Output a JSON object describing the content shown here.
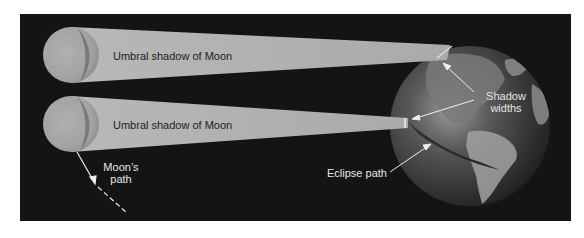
{
  "diagram": {
    "type": "solar-eclipse-umbral-shadow",
    "colors": {
      "background": "#141414",
      "beam": "#b4b4b4",
      "moon": "#a8a8a8",
      "arrow": "#eeeeee",
      "label_dark": "#1e1e1e",
      "label_light": "#e6e6e6"
    },
    "labels": {
      "beam_top": "Umbral shadow of Moon",
      "beam_bottom": "Umbral shadow of Moon",
      "shadow_widths_line1": "Shadow",
      "shadow_widths_line2": "widths",
      "moons_path_line1": "Moon’s",
      "moons_path_line2": "path",
      "eclipse_path": "Eclipse path"
    },
    "objects": [
      {
        "name": "moon-top",
        "cx": 71,
        "cy": 55,
        "r": 28
      },
      {
        "name": "moon-bottom",
        "cx": 71,
        "cy": 124,
        "r": 28
      },
      {
        "name": "earth",
        "cx": 470,
        "cy": 126,
        "r": 80
      }
    ]
  }
}
